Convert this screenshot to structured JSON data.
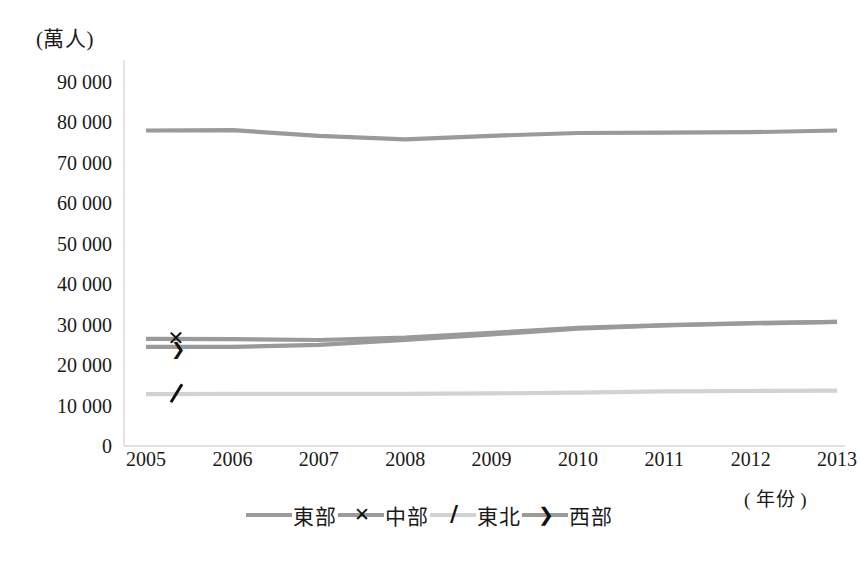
{
  "chart_data": {
    "type": "line",
    "title": "",
    "xlabel": "( 年份 )",
    "ylabel": "(萬人)",
    "x": [
      2005,
      2006,
      2007,
      2008,
      2009,
      2010,
      2011,
      2012,
      2013
    ],
    "xticklabels": [
      "2005",
      "2006",
      "2007",
      "2008",
      "2009",
      "2010",
      "2011",
      "2012",
      "2013"
    ],
    "yticklabels": [
      "90 000",
      "80 000",
      "70 000",
      "60 000",
      "50 000",
      "40 000",
      "30 000",
      "20 000",
      "10 000",
      "0"
    ],
    "ylim": [
      0,
      90000
    ],
    "ytickvalues": [
      90000,
      80000,
      70000,
      60000,
      50000,
      40000,
      30000,
      20000,
      10000,
      0
    ],
    "grid": false,
    "legend_position": "bottom",
    "series": [
      {
        "name": "東部",
        "marker": "line",
        "color": "#9a9a9a",
        "values": [
          78000,
          78100,
          76700,
          75800,
          76700,
          77400,
          77500,
          77600,
          78000
        ]
      },
      {
        "name": "中部",
        "marker": "x",
        "color": "#9a9a9a",
        "values": [
          26500,
          26400,
          26200,
          26800,
          28000,
          29200,
          29900,
          30400,
          30700
        ]
      },
      {
        "name": "東北",
        "marker": "slash",
        "color": "#d2d2d2",
        "values": [
          12800,
          12900,
          12900,
          12900,
          13000,
          13200,
          13500,
          13600,
          13700
        ]
      },
      {
        "name": "西部",
        "marker": "arrow",
        "color": "#9a9a9a",
        "values": [
          24500,
          24500,
          25000,
          26200,
          27600,
          29000,
          29800,
          30300,
          30700
        ]
      }
    ]
  },
  "axes": {
    "unit_label": "(萬人)",
    "year_caption": "( 年份 )"
  },
  "legend": {
    "items": [
      {
        "label": "東部",
        "marker": "line"
      },
      {
        "label": "中部",
        "marker": "x"
      },
      {
        "label": "東北",
        "marker": "slash"
      },
      {
        "label": "西部",
        "marker": "arrow"
      }
    ]
  }
}
